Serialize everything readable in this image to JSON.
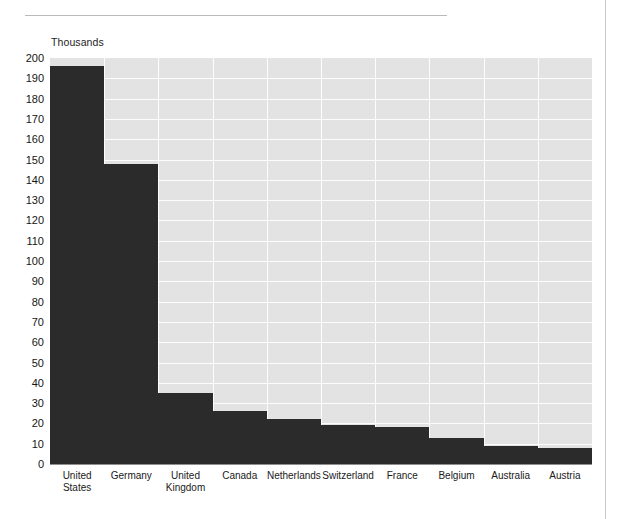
{
  "page": {
    "background_color": "#ffffff",
    "rule_color": "#b9b9b9",
    "edge_color": "#c9c9c9"
  },
  "chart_data": {
    "type": "bar",
    "title": "",
    "subtitle": "",
    "unit_label": "Thousands",
    "xlabel": "",
    "ylabel": "",
    "ylim": [
      0,
      200
    ],
    "ytick_step": 10,
    "grid": true,
    "legend": "none",
    "bar_color": "#2b2b2b",
    "plot_background": "#e3e3e3",
    "gridline_color": "#fdfdfd",
    "axis_color": "#8f8f8f",
    "categories": [
      "United States",
      "Germany",
      "United Kingdom",
      "Canada",
      "Netherlands",
      "Switzerland",
      "France",
      "Belgium",
      "Australia",
      "Austria"
    ],
    "values": [
      196,
      148,
      35,
      26,
      22,
      19,
      18,
      13,
      9,
      8
    ],
    "yticks": [
      0,
      10,
      20,
      30,
      40,
      50,
      60,
      70,
      80,
      90,
      100,
      110,
      120,
      130,
      140,
      150,
      160,
      170,
      180,
      190,
      200
    ]
  }
}
